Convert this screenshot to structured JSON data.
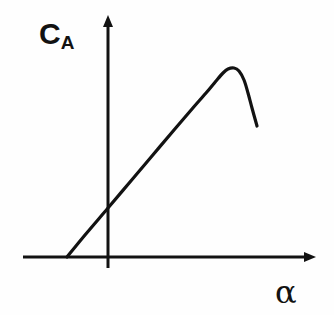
{
  "figure": {
    "name": "lift-coefficient-vs-angle-of-attack-sketch",
    "background_color": "#fefefe",
    "ink_color": "#121212"
  },
  "labels": {
    "y_axis_symbol": "C",
    "y_axis_subscript": "A",
    "y_axis_full": "C_A",
    "x_axis_symbol": "α"
  },
  "chart_data": {
    "type": "line",
    "title": "",
    "subtitle": "",
    "xlabel": "α",
    "ylabel": "C_A",
    "grid": false,
    "legend": null,
    "tick_labels": {
      "x": [],
      "y": []
    },
    "axes": {
      "x_axis_y_px": 257,
      "y_axis_x_px": 108,
      "x_axis_start_px": 23,
      "x_axis_end_px": 316,
      "y_axis_top_px": 14,
      "y_axis_bottom_px": 268,
      "arrowheads": [
        "x-axis-right",
        "y-axis-top"
      ]
    },
    "annotations": [
      {
        "name": "zero-lift-intercept",
        "x_px": 67,
        "y_px": 257
      },
      {
        "name": "y-axis-crossing",
        "x_px": 108,
        "y_px": 208
      },
      {
        "name": "stall-peak",
        "x_px": 228,
        "y_px": 69
      },
      {
        "name": "post-stall-end",
        "x_px": 257,
        "y_px": 126
      }
    ],
    "series": [
      {
        "name": "C_A curve",
        "color": "#121212",
        "line_width_px": 3.2,
        "points_px": [
          [
            67,
            257
          ],
          [
            85,
            235
          ],
          [
            108,
            208
          ],
          [
            130,
            182
          ],
          [
            152,
            156
          ],
          [
            174,
            130
          ],
          [
            192,
            109
          ],
          [
            206,
            93
          ],
          [
            216,
            81
          ],
          [
            223,
            73
          ],
          [
            228,
            69
          ],
          [
            234,
            68
          ],
          [
            239,
            71
          ],
          [
            244,
            80
          ],
          [
            248,
            93
          ],
          [
            252,
            108
          ],
          [
            257,
            126
          ]
        ]
      }
    ]
  }
}
